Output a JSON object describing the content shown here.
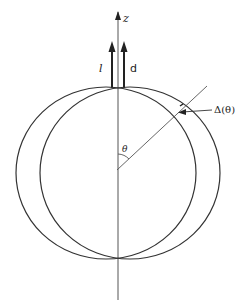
{
  "diagram": {
    "labels": {
      "z_axis": "z",
      "vector_l": "l",
      "vector_d": "d",
      "angle": "θ",
      "delta": "Δ(θ)"
    },
    "colors": {
      "stroke": "#333333",
      "axis": "#555555",
      "background": "#ffffff"
    }
  }
}
